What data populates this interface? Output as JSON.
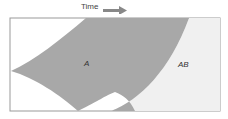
{
  "diagram": {
    "axis_label": "Time",
    "regions": [
      {
        "label": "A",
        "color": "#a8a8a8"
      },
      {
        "label": "AB",
        "color": "#f0f0f0"
      }
    ],
    "border_color": "#999999"
  }
}
